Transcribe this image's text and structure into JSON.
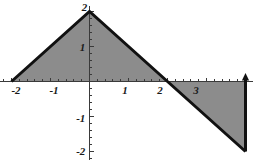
{
  "chart_data": {
    "type": "area",
    "title": "",
    "xlabel": "",
    "ylabel": "",
    "xlim": [
      -2.3,
      4.4
    ],
    "ylim": [
      -2.25,
      2.15
    ],
    "grid": false,
    "legend": null,
    "series": [
      {
        "name": "piecewise-linear-curve",
        "points": [
          {
            "x": -2,
            "y": 0
          },
          {
            "x": 0,
            "y": 2
          },
          {
            "x": 2,
            "y": 0
          },
          {
            "x": 4,
            "y": -2
          }
        ]
      }
    ],
    "shaded_regions": [
      {
        "name": "positive-area",
        "sign": "positive",
        "vertices": [
          {
            "x": -2,
            "y": 0
          },
          {
            "x": 0,
            "y": 2
          },
          {
            "x": 2,
            "y": 0
          }
        ],
        "fill": "#8c8c8c"
      },
      {
        "name": "negative-area",
        "sign": "negative",
        "vertices": [
          {
            "x": 2,
            "y": 0
          },
          {
            "x": 4,
            "y": -2
          },
          {
            "x": 4,
            "y": 0
          }
        ],
        "fill": "#8c8c8c"
      }
    ],
    "x_axis": {
      "tick_labels": [
        "-2",
        "-1",
        "1",
        "2",
        "3"
      ],
      "tick_values": [
        -2,
        -1,
        1,
        2,
        3
      ],
      "minor_ticks_per_unit": 5,
      "axis_line_color": "#3a3a3a"
    },
    "y_axis": {
      "tick_labels": [
        "2",
        "1",
        "-1",
        "-2"
      ],
      "tick_values": [
        2,
        1,
        -1,
        -2
      ],
      "minor_ticks_per_unit": 5,
      "axis_line_color": "#3a3a3a"
    },
    "curve_color": "#111111",
    "curve_width_px": 3,
    "background": "#ffffff",
    "right_edge_marker": {
      "x": 4,
      "shape": "up-arrow"
    }
  },
  "labels": {
    "x": [
      {
        "id": "x-neg2",
        "text": "-2",
        "value": -2
      },
      {
        "id": "x-neg1",
        "text": "-1",
        "value": -1
      },
      {
        "id": "x-pos1",
        "text": "1",
        "value": 1
      },
      {
        "id": "x-pos2",
        "text": "2",
        "value": 2
      },
      {
        "id": "x-pos3",
        "text": "3",
        "value": 3
      }
    ],
    "y": [
      {
        "id": "y-pos2",
        "text": "2",
        "value": 2
      },
      {
        "id": "y-pos1",
        "text": "1",
        "value": 1
      },
      {
        "id": "y-neg1",
        "text": "-1",
        "value": -1
      },
      {
        "id": "y-neg2",
        "text": "-2",
        "value": -2
      }
    ]
  }
}
